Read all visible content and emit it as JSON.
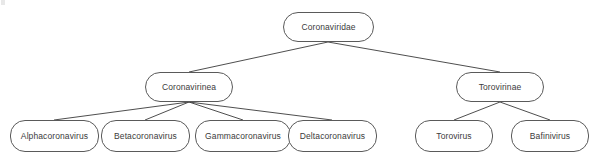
{
  "diagram": {
    "type": "tree",
    "colors": {
      "background": "#ffffff",
      "node_stroke": "#5a5a5a",
      "node_fill": "#ffffff",
      "edge_stroke": "#3a3a3a",
      "label_text": "#3b3b3b"
    },
    "levels": [
      {
        "level": 1,
        "nodes": [
          {
            "id": "coronaviridae",
            "label": "Coronaviridae",
            "x": 283,
            "y": 12,
            "w": 91,
            "h": 30
          }
        ]
      },
      {
        "level": 2,
        "nodes": [
          {
            "id": "coronavirinea",
            "label": "Coronavirinea",
            "x": 145,
            "y": 72,
            "w": 88,
            "h": 30
          },
          {
            "id": "torovirinae",
            "label": "Torovirinae",
            "x": 456,
            "y": 72,
            "w": 88,
            "h": 30
          }
        ]
      },
      {
        "level": 3,
        "nodes": [
          {
            "id": "alphacoronavirus",
            "label": "Alphacoronavirus",
            "x": 10,
            "y": 120,
            "w": 89,
            "h": 32
          },
          {
            "id": "betacoronavirus",
            "label": "Betacoronavirus",
            "x": 101,
            "y": 120,
            "w": 89,
            "h": 32
          },
          {
            "id": "gammacoronavirus",
            "label": "Gammacoronavirus",
            "x": 195,
            "y": 120,
            "w": 96,
            "h": 32
          },
          {
            "id": "deltacoronavirus",
            "label": "Deltacoronavirus",
            "x": 288,
            "y": 120,
            "w": 89,
            "h": 32
          },
          {
            "id": "torovirus",
            "label": "Torovirus",
            "x": 415,
            "y": 120,
            "w": 78,
            "h": 32
          },
          {
            "id": "bafinivirus",
            "label": "Bafinivirus",
            "x": 511,
            "y": 120,
            "w": 78,
            "h": 32
          }
        ]
      }
    ],
    "edges": [
      {
        "id": "edge-coronaviridae-coronavirinea",
        "from": "coronaviridae",
        "to": "coronavirinea",
        "x1": 328,
        "y1": 42,
        "x2": 189,
        "y2": 72
      },
      {
        "id": "edge-coronaviridae-torovirinae",
        "from": "coronaviridae",
        "to": "torovirinae",
        "x1": 328,
        "y1": 42,
        "x2": 500,
        "y2": 72
      },
      {
        "id": "edge-coronavirinea-alphacoronavirus",
        "from": "coronavirinea",
        "to": "alphacoronavirus",
        "x1": 189,
        "y1": 102,
        "x2": 54,
        "y2": 120
      },
      {
        "id": "edge-coronavirinea-betacoronavirus",
        "from": "coronavirinea",
        "to": "betacoronavirus",
        "x1": 189,
        "y1": 102,
        "x2": 145,
        "y2": 120
      },
      {
        "id": "edge-coronavirinea-gammacoronavirus",
        "from": "coronavirinea",
        "to": "gammacoronavirus",
        "x1": 189,
        "y1": 102,
        "x2": 243,
        "y2": 120
      },
      {
        "id": "edge-coronavirinea-deltacoronavirus",
        "from": "coronavirinea",
        "to": "deltacoronavirus",
        "x1": 189,
        "y1": 102,
        "x2": 332,
        "y2": 120
      },
      {
        "id": "edge-torovirinae-torovirus",
        "from": "torovirinae",
        "to": "torovirus",
        "x1": 500,
        "y1": 102,
        "x2": 454,
        "y2": 120
      },
      {
        "id": "edge-torovirinae-bafinivirus",
        "from": "torovirinae",
        "to": "bafinivirus",
        "x1": 500,
        "y1": 102,
        "x2": 550,
        "y2": 120
      }
    ]
  }
}
